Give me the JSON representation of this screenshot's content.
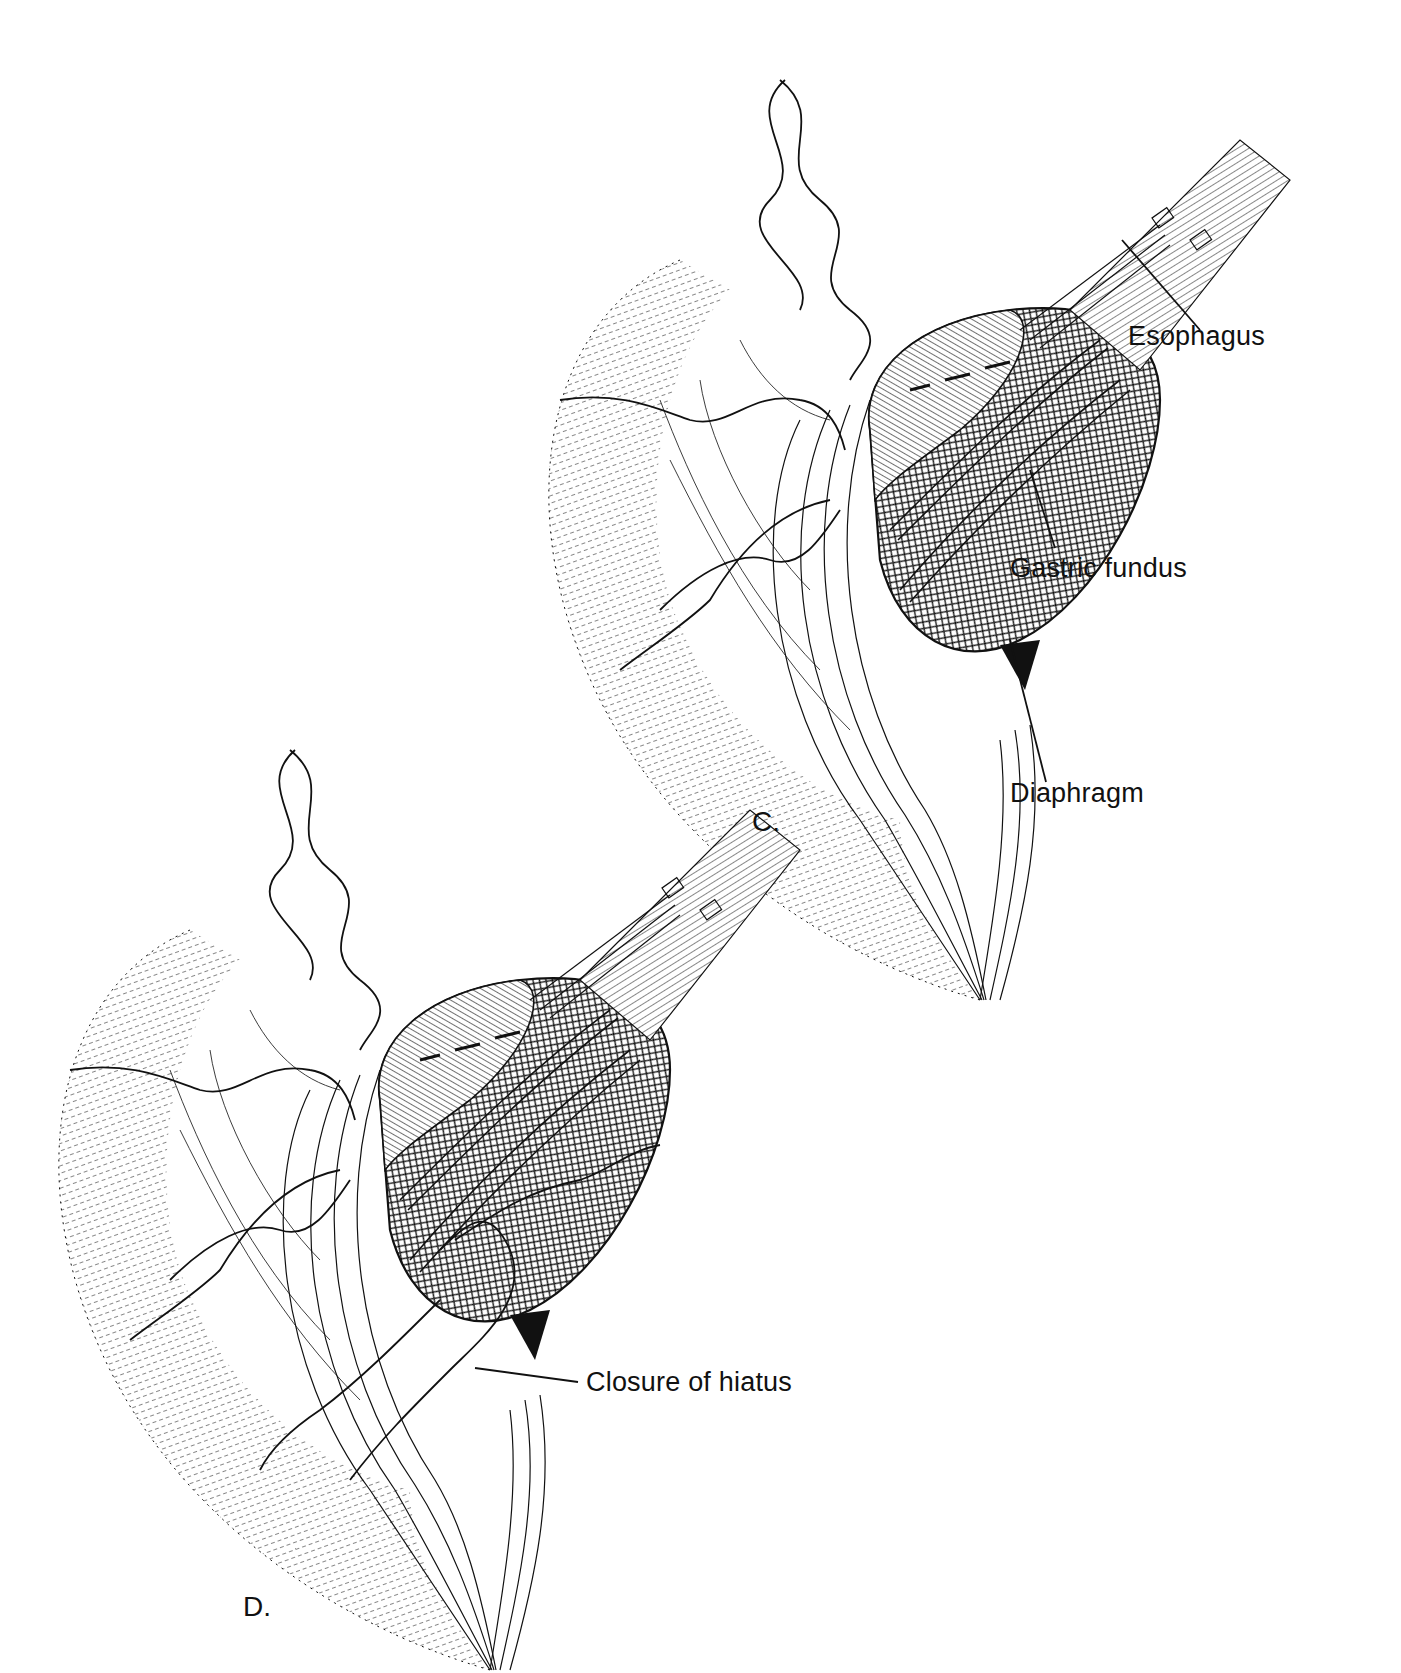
{
  "figure": {
    "type": "surgical-illustration",
    "style": "black-and-white line drawing",
    "colors": {
      "ink": "#111111",
      "background": "#ffffff"
    }
  },
  "panels": [
    {
      "id": "C",
      "letter": "C.",
      "labels": [
        {
          "id": "esophagus",
          "text": "Esophagus"
        },
        {
          "id": "gastric-fundus",
          "text": "Gastric fundus"
        },
        {
          "id": "diaphragm",
          "text": "Diaphragm"
        }
      ]
    },
    {
      "id": "D",
      "letter": "D.",
      "labels": [
        {
          "id": "closure-of-hiatus",
          "text": "Closure of hiatus"
        }
      ]
    }
  ]
}
